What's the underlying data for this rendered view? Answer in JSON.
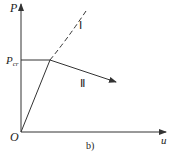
{
  "diagram": {
    "y_axis_label": "P",
    "x_axis_label": "u",
    "origin_label": "O",
    "critical_load_label": "P",
    "critical_load_subscript": "cr",
    "branch_1_label": "Ⅰ",
    "branch_2_label": "Ⅱ",
    "caption": "b)",
    "colors": {
      "line": "#333333",
      "background": "#ffffff"
    }
  }
}
